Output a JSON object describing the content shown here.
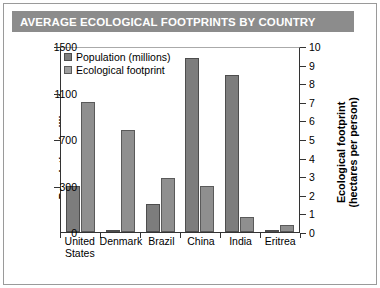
{
  "title": "AVERAGE ECOLOGICAL FOOTPRINTS BY COUNTRY",
  "colors": {
    "title_bar": "#8c8c8c",
    "population_bar": "#7d7d7d",
    "footprint_bar": "#8f8f8f",
    "axis": "#333333"
  },
  "legend": {
    "position": "top-left",
    "items": [
      {
        "label": "Population (millions)",
        "swatch": "population-swatch"
      },
      {
        "label": "Ecological footprint",
        "swatch": "footprint-swatch"
      }
    ]
  },
  "chart_data": {
    "type": "bar",
    "title": "AVERAGE ECOLOGICAL FOOTPRINTS BY COUNTRY",
    "xlabel": "",
    "categories": [
      "United States",
      "Denmark",
      "Brazil",
      "China",
      "India",
      "Eritrea"
    ],
    "series": [
      {
        "name": "Population (millions)",
        "axis": "left",
        "values": [
          300,
          5,
          180,
          1400,
          1250,
          4
        ]
      },
      {
        "name": "Ecological footprint",
        "axis": "right",
        "values": [
          7.0,
          5.5,
          2.9,
          2.5,
          0.8,
          0.4
        ]
      }
    ],
    "left_axis": {
      "label": "Population (millions)",
      "ticks": [
        0,
        300,
        700,
        1100,
        1500
      ],
      "ylim": [
        0,
        1500
      ]
    },
    "right_axis": {
      "label": "Ecological footprint (hectares per person)",
      "label_line1": "Ecological footprint",
      "label_line2": "(hectares per person)",
      "ticks": [
        0,
        1,
        2,
        3,
        4,
        5,
        6,
        7,
        8,
        9,
        10
      ],
      "ylim": [
        0,
        10
      ]
    },
    "grid": false,
    "legend_position": "top-left"
  }
}
